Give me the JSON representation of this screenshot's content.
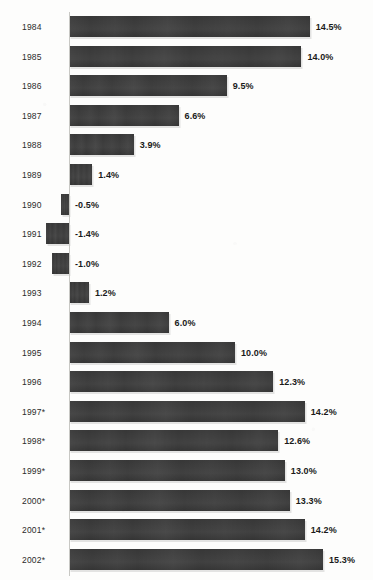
{
  "chart_data": {
    "type": "bar",
    "orientation": "horizontal",
    "title": "",
    "subtitle": "",
    "xlabel": "",
    "ylabel": "",
    "grid": false,
    "legend": null,
    "value_suffix": "%",
    "xlim": [
      -1.4,
      15.3
    ],
    "zero_baseline": 0,
    "categories": [
      "1984",
      "1985",
      "1986",
      "1987",
      "1988",
      "1989",
      "1990",
      "1991",
      "1992",
      "1993",
      "1994",
      "1995",
      "1996",
      "1997*",
      "1998*",
      "1999*",
      "2000*",
      "2001*",
      "2002*"
    ],
    "values": [
      14.5,
      14.0,
      9.5,
      6.6,
      3.9,
      1.4,
      -0.5,
      -1.4,
      -1.0,
      1.2,
      6.0,
      10.0,
      12.3,
      14.2,
      12.6,
      13.0,
      13.3,
      14.2,
      15.3
    ],
    "value_labels": [
      "14.5%",
      "14.0%",
      "9.5%",
      "6.6%",
      "3.9%",
      "1.4%",
      "-0.5%",
      "-1.4%",
      "-1.0%",
      "1.2%",
      "6.0%",
      "10.0%",
      "12.3%",
      "14.2%",
      "12.6%",
      "13.0%",
      "13.3%",
      "14.2%",
      "15.3%"
    ],
    "rows": [
      {
        "year": "1984",
        "value": 14.5,
        "label": "14.5%"
      },
      {
        "year": "1985",
        "value": 14.0,
        "label": "14.0%"
      },
      {
        "year": "1986",
        "value": 9.5,
        "label": "9.5%"
      },
      {
        "year": "1987",
        "value": 6.6,
        "label": "6.6%"
      },
      {
        "year": "1988",
        "value": 3.9,
        "label": "3.9%"
      },
      {
        "year": "1989",
        "value": 1.4,
        "label": "1.4%"
      },
      {
        "year": "1990",
        "value": -0.5,
        "label": "-0.5%"
      },
      {
        "year": "1991",
        "value": -1.4,
        "label": "-1.4%"
      },
      {
        "year": "1992",
        "value": -1.0,
        "label": "-1.0%"
      },
      {
        "year": "1993",
        "value": 1.2,
        "label": "1.2%"
      },
      {
        "year": "1994",
        "value": 6.0,
        "label": "6.0%"
      },
      {
        "year": "1995",
        "value": 10.0,
        "label": "10.0%"
      },
      {
        "year": "1996",
        "value": 12.3,
        "label": "12.3%"
      },
      {
        "year": "1997*",
        "value": 14.2,
        "label": "14.2%"
      },
      {
        "year": "1998*",
        "value": 12.6,
        "label": "12.6%"
      },
      {
        "year": "1999*",
        "value": 13.0,
        "label": "13.0%"
      },
      {
        "year": "2000*",
        "value": 13.3,
        "label": "13.3%"
      },
      {
        "year": "2001*",
        "value": 14.2,
        "label": "14.2%"
      },
      {
        "year": "2002*",
        "value": 15.3,
        "label": "15.3%"
      }
    ]
  },
  "style": {
    "bar_color": "#3a3a3a",
    "background_color": "#fdfdfc",
    "label_color": "#2b2b2b",
    "value_color": "#1a1a1a",
    "axis_color": "#c8c8c4"
  },
  "geometry": {
    "zero_x": 69,
    "px_per_unit": 16.6,
    "row_pitch": 29.6,
    "first_row_top": 16,
    "bar_height": 21,
    "value_gap": 6
  }
}
